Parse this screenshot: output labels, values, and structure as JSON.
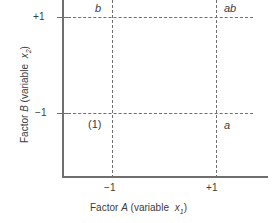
{
  "figure": {
    "kind": "2k-factorial-design-square",
    "background_color": "#ffffff",
    "line_color": "#6f6f6f",
    "text_color": "#3c3c3c"
  },
  "axes": {
    "x": {
      "title_prefix": "Factor ",
      "title_factor": "A",
      "title_middle": " (variable ",
      "title_var": "x",
      "title_var_sub": "1",
      "title_suffix": ")",
      "ticks": [
        {
          "label": "−1",
          "value": -1
        },
        {
          "label": "+1",
          "value": 1
        }
      ]
    },
    "y": {
      "title_prefix": "Factor ",
      "title_factor": "B",
      "title_middle": " (variable ",
      "title_var": "x",
      "title_var_sub": "2",
      "title_suffix": ")",
      "ticks": [
        {
          "label": "+1",
          "value": 1
        },
        {
          "label": "−1",
          "value": -1
        }
      ]
    }
  },
  "chart_data": {
    "type": "scatter",
    "title": "",
    "xlabel": "Factor A (variable x1)",
    "ylabel": "Factor B (variable x2)",
    "xlim": [
      -1.6,
      1.6
    ],
    "ylim": [
      -1.6,
      1.6
    ],
    "xticks": [
      -1,
      1
    ],
    "xticklabels": [
      "−1",
      "+1"
    ],
    "yticks": [
      -1,
      1
    ],
    "yticklabels": [
      "+1",
      "−1"
    ],
    "grid": "dashed-guides-at-factor-levels",
    "legend": "none",
    "annotations": [
      {
        "label": "(1)",
        "x": -1,
        "y": -1,
        "italic": false,
        "placement": "below-left"
      },
      {
        "label": "a",
        "x": 1,
        "y": -1,
        "italic": true,
        "placement": "below-right"
      },
      {
        "label": "b",
        "x": -1,
        "y": 1,
        "italic": true,
        "placement": "above-left"
      },
      {
        "label": "ab",
        "x": 1,
        "y": 1,
        "italic": true,
        "placement": "above-right"
      }
    ],
    "points": [
      {
        "name": "(1)",
        "x": -1,
        "y": -1
      },
      {
        "name": "a",
        "x": 1,
        "y": -1
      },
      {
        "name": "b",
        "x": -1,
        "y": 1
      },
      {
        "name": "ab",
        "x": 1,
        "y": 1
      }
    ]
  },
  "labels": {
    "b": "b",
    "ab": "ab",
    "one": "(1)",
    "a": "a"
  }
}
